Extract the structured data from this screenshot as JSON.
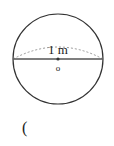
{
  "diagram": {
    "type": "sphere",
    "label": "1 m",
    "center_label": "o",
    "answer_prefix": "("
  }
}
